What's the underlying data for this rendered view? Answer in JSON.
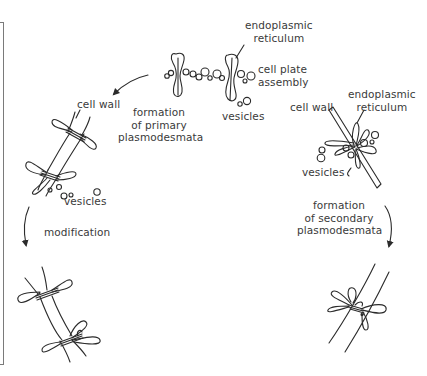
{
  "diagram": {
    "stages": [
      {
        "id": "cell-plate-assembly",
        "labels": [
          "endoplasmic reticulum",
          "cell plate assembly",
          "vesicles"
        ]
      },
      {
        "id": "primary-plasmodesmata",
        "labels": [
          "cell wall",
          "vesicles"
        ]
      },
      {
        "id": "modified-primary",
        "labels": []
      },
      {
        "id": "secondary-start",
        "labels": [
          "cell wall",
          "endoplasmic reticulum",
          "vesicles"
        ]
      },
      {
        "id": "secondary-plasmodesmata",
        "labels": []
      }
    ],
    "arrows": [
      {
        "from": "cell-plate-assembly",
        "to": "primary-plasmodesmata",
        "label": "formation of primary plasmodesmata"
      },
      {
        "from": "primary-plasmodesmata",
        "to": "modified-primary",
        "label": "modification"
      },
      {
        "from": "secondary-start",
        "to": "secondary-plasmodesmata",
        "label": "formation of secondary plasmodesmata"
      }
    ]
  },
  "labels": {
    "top_er": [
      "endoplasmic",
      "reticulum"
    ],
    "cell_plate": [
      "cell plate",
      "assembly"
    ],
    "top_vesicles": "vesicles",
    "left_cell_wall": "cell wall",
    "primary_formation": [
      "formation",
      "of primary",
      "plasmodesmata"
    ],
    "left_vesicles": "vesicles",
    "modification": "modification",
    "right_cell_wall": "cell wall",
    "right_er": [
      "endoplasmic",
      "reticulum"
    ],
    "right_vesicles": "vesicles",
    "secondary_formation": [
      "formation",
      "of secondary",
      "plasmodesmata"
    ]
  }
}
